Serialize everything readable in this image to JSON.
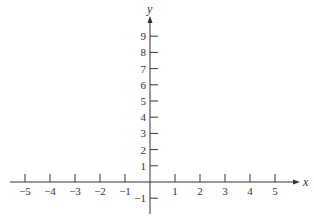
{
  "chart_data": {
    "type": "line",
    "title": "",
    "xlabel": "x",
    "ylabel": "y",
    "xlim": [
      -5.5,
      5.8
    ],
    "ylim": [
      -1.8,
      10.3
    ],
    "x_ticks": [
      -5,
      -4,
      -3,
      -2,
      -1,
      1,
      2,
      3,
      4,
      5
    ],
    "x_tick_labels": [
      "−5",
      "−4",
      "−3",
      "−2",
      "−1",
      "1",
      "2",
      "3",
      "4",
      "5"
    ],
    "y_ticks": [
      -1,
      1,
      2,
      3,
      4,
      5,
      6,
      7,
      8,
      9
    ],
    "y_tick_labels": [
      "−1",
      "1",
      "2",
      "3",
      "4",
      "5",
      "6",
      "7",
      "8",
      "9"
    ],
    "series": [],
    "grid": false,
    "legend": null
  },
  "layout": {
    "origin_px": [
      150,
      182
    ],
    "x_unit_px": 25,
    "y_unit_px": 16.2,
    "x_axis_start_px": 10,
    "x_axis_end_px": 300,
    "y_axis_top_px": 16,
    "y_axis_bottom_px": 214,
    "axis_color": "#333333"
  }
}
